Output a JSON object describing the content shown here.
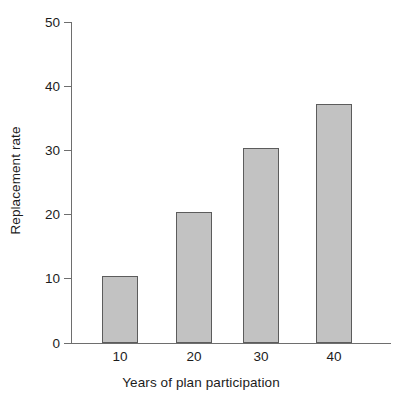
{
  "chart_data": {
    "type": "bar",
    "title": "",
    "xlabel": "Years of plan participation",
    "ylabel": "Replacement rate",
    "categories": [
      "10",
      "20",
      "30",
      "40"
    ],
    "values": [
      10.4,
      20.4,
      30.4,
      37.2
    ],
    "series": [
      {
        "name": "Replacement rate",
        "values": [
          10.4,
          20.4,
          30.4,
          37.2
        ]
      }
    ],
    "ylim": [
      0,
      50
    ],
    "yticks": [
      0,
      10,
      20,
      30,
      40,
      50
    ],
    "ytick_labels": [
      "0",
      "10",
      "20",
      "30",
      "40",
      "50"
    ],
    "xtick_labels": [
      "10",
      "20",
      "30",
      "40"
    ],
    "grid": false,
    "legend": false,
    "legend_position": "none",
    "colors": {
      "bar_fill": "#c2c2c2",
      "bar_edge": "#5c5c5c",
      "axis": "#6e6e6e",
      "text": "#1c1c1c",
      "background": "#ffffff"
    }
  }
}
